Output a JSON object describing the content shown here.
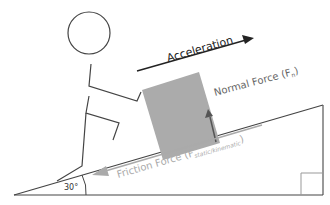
{
  "diagram": {
    "labels": {
      "acceleration": "Acceleration",
      "normal_force": "Normal Force (F",
      "normal_sub": "n",
      "normal_close": ")",
      "friction_force": "Friction Force (F",
      "friction_sub": "static/kinematic",
      "friction_close": ")",
      "angle": "30°"
    },
    "incline_angle_deg": 30,
    "colors": {
      "line": "#333333",
      "box_fill": "#aaaaaa",
      "friction": "#aaaaaa",
      "normal_text": "#666666",
      "friction_text": "#aaaaaa",
      "right_angle": "#999999"
    }
  }
}
